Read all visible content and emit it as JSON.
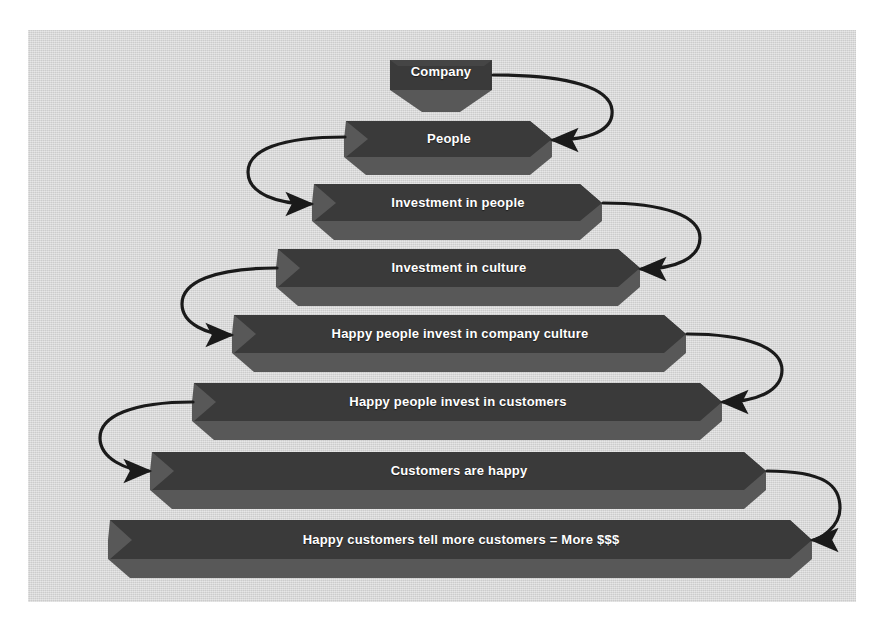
{
  "diagram": {
    "type": "funnel-flow",
    "canvas": {
      "background_color": "#d8d8d8",
      "page_background_color": "#ffffff"
    },
    "style": {
      "band_face_color": "#3a3a3a",
      "band_side_color": "#585858",
      "band_text_color": "#ffffff",
      "arrow_color": "#1a1a1a"
    },
    "nodes": [
      {
        "id": "company",
        "label": "Company",
        "order": 1,
        "font_size": 13
      },
      {
        "id": "people",
        "label": "People",
        "order": 2,
        "font_size": 13
      },
      {
        "id": "invest-people",
        "label": "Investment in people",
        "order": 3,
        "font_size": 13
      },
      {
        "id": "invest-culture",
        "label": "Investment in culture",
        "order": 4,
        "font_size": 13
      },
      {
        "id": "invest-company",
        "label": "Happy people invest in company culture",
        "order": 5,
        "font_size": 13
      },
      {
        "id": "invest-customers",
        "label": "Happy people invest in customers",
        "order": 6,
        "font_size": 13
      },
      {
        "id": "customers-happy",
        "label": "Customers are happy",
        "order": 7,
        "font_size": 13
      },
      {
        "id": "more-money",
        "label": "Happy customers tell more customers = More $$$",
        "order": 8,
        "font_size": 13
      }
    ],
    "connectors": [
      {
        "from": "company",
        "to": "people",
        "side": "right",
        "arrowhead": "filled-triangle"
      },
      {
        "from": "people",
        "to": "invest-people",
        "side": "left",
        "arrowhead": "filled-triangle"
      },
      {
        "from": "invest-people",
        "to": "invest-culture",
        "side": "right",
        "arrowhead": "filled-triangle"
      },
      {
        "from": "invest-culture",
        "to": "invest-company",
        "side": "left",
        "arrowhead": "filled-triangle"
      },
      {
        "from": "invest-company",
        "to": "invest-customers",
        "side": "right",
        "arrowhead": "filled-triangle"
      },
      {
        "from": "invest-customers",
        "to": "customers-happy",
        "side": "left",
        "arrowhead": "filled-triangle"
      },
      {
        "from": "customers-happy",
        "to": "more-money",
        "side": "right",
        "arrowhead": "filled-triangle"
      }
    ]
  }
}
